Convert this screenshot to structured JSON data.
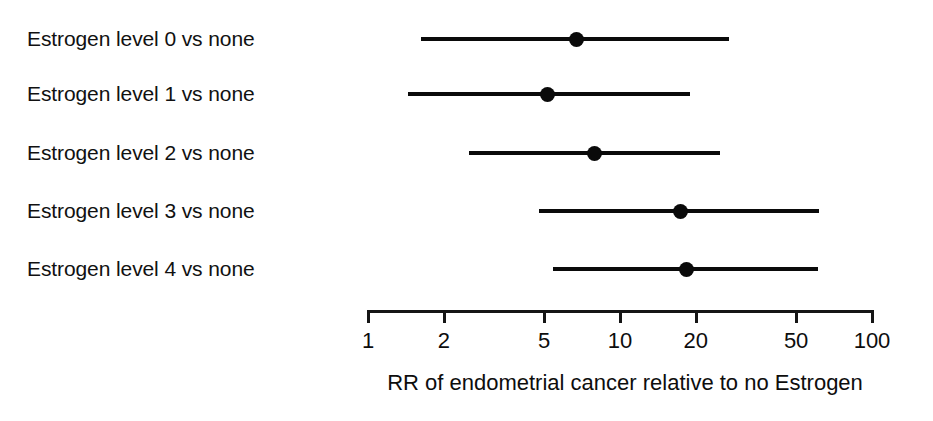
{
  "chart_data": {
    "type": "scatter",
    "subtype": "forest-plot",
    "title": "",
    "xlabel": "RR of endometrial cancer relative to no Estrogen",
    "ylabel": "",
    "xscale": "log10",
    "xlim": [
      1,
      100
    ],
    "grid": false,
    "legend": null,
    "x_ticks": [
      {
        "value": 1,
        "label": "1"
      },
      {
        "value": 2,
        "label": "2"
      },
      {
        "value": 5,
        "label": "5"
      },
      {
        "value": 10,
        "label": "10"
      },
      {
        "value": 20,
        "label": "20"
      },
      {
        "value": 50,
        "label": "50"
      },
      {
        "value": 100,
        "label": "100"
      }
    ],
    "categories": [
      "Estrogen level 0 vs none",
      "Estrogen level 1 vs none",
      "Estrogen level 2 vs none",
      "Estrogen level 3 vs none",
      "Estrogen level 4 vs none"
    ],
    "rows": [
      {
        "label": "Estrogen level 0 vs none",
        "estimate": 6.8,
        "ci_low": 1.64,
        "ci_high": 27.3
      },
      {
        "label": "Estrogen level 1 vs none",
        "estimate": 5.2,
        "ci_low": 1.45,
        "ci_high": 19.1
      },
      {
        "label": "Estrogen level 2 vs none",
        "estimate": 8.0,
        "ci_low": 2.54,
        "ci_high": 25.1
      },
      {
        "label": "Estrogen level 3 vs none",
        "estimate": 17.5,
        "ci_low": 4.8,
        "ci_high": 62.0
      },
      {
        "label": "Estrogen level 4 vs none",
        "estimate": 18.6,
        "ci_low": 5.45,
        "ci_high": 61.6
      }
    ],
    "marker_color": "#0a0a0a",
    "line_color": "#0a0a0a",
    "axis_color": "#151515",
    "background_color": "#ffffff"
  },
  "layout": {
    "plot_x_origin_px": 367,
    "px_per_decade": 252,
    "row_y_px": [
      39,
      94,
      153,
      211,
      269
    ],
    "label_x_px": 27,
    "axis_y_px": 310,
    "tick_length_px": 13,
    "tick_label_y_px": 330,
    "axis_title_center_x_px": 625,
    "axis_title_y_px": 371
  }
}
